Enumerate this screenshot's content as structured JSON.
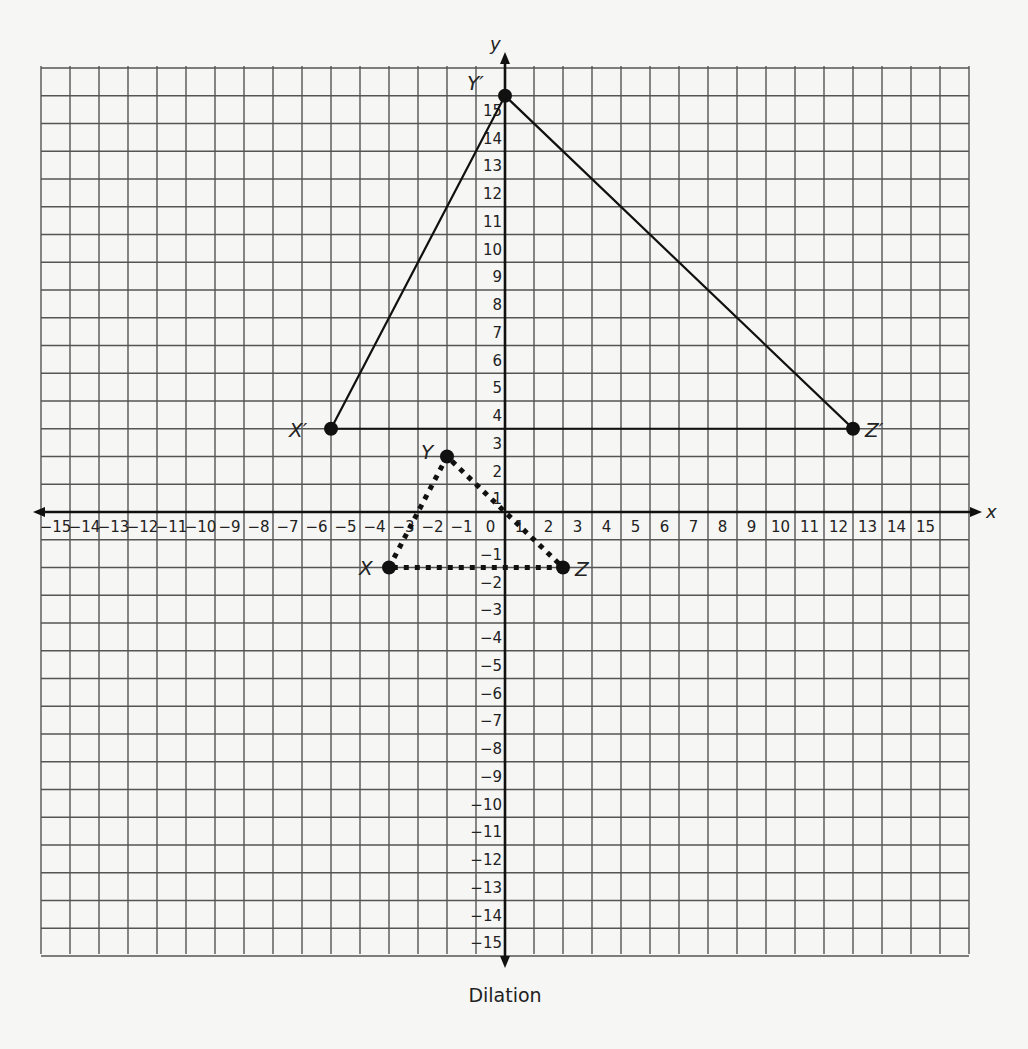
{
  "caption": "Dilation",
  "chart_data": {
    "type": "scatter",
    "title": "Dilation",
    "xlabel": "x",
    "ylabel": "y",
    "xlim": [
      -16,
      16
    ],
    "ylim": [
      -16,
      16
    ],
    "grid": true,
    "x_ticks": [
      -15,
      -14,
      -13,
      -12,
      -11,
      -10,
      -9,
      -8,
      -7,
      -6,
      -5,
      -4,
      -3,
      -2,
      -1,
      0,
      1,
      2,
      3,
      4,
      5,
      6,
      7,
      8,
      9,
      10,
      11,
      12,
      13,
      14,
      15
    ],
    "y_ticks": [
      -15,
      -14,
      -13,
      -12,
      -11,
      -10,
      -9,
      -8,
      -7,
      -6,
      -5,
      -4,
      -3,
      -2,
      -1,
      1,
      2,
      3,
      4,
      5,
      6,
      7,
      8,
      9,
      10,
      11,
      12,
      13,
      14,
      15
    ],
    "series": [
      {
        "name": "Triangle XYZ (pre-image)",
        "style": "dotted",
        "points": [
          {
            "label": "X",
            "x": -4,
            "y": -2
          },
          {
            "label": "Y",
            "x": -2,
            "y": 2
          },
          {
            "label": "Z",
            "x": 2,
            "y": -2
          }
        ]
      },
      {
        "name": "Triangle X'Y'Z' (image)",
        "style": "solid",
        "points": [
          {
            "label": "X′",
            "x": -6,
            "y": 3
          },
          {
            "label": "Y′",
            "x": 0,
            "y": 15
          },
          {
            "label": "Z′",
            "x": 12,
            "y": 3
          }
        ]
      }
    ],
    "extra_line": {
      "from": [
        -2,
        2
      ],
      "to": [
        0,
        0
      ],
      "style": "dotted",
      "note": "dotted segment from Y continues through origin to Z"
    }
  }
}
